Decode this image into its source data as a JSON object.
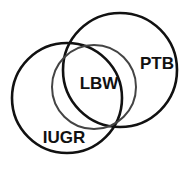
{
  "figure": {
    "type": "venn-diagram",
    "title": "",
    "background_color": "#ffffff",
    "width": 190,
    "height": 170
  },
  "sets": [
    {
      "id": "ptb",
      "label": "PTB",
      "label_x": 157,
      "label_y": 65,
      "font_size": 17,
      "circle": {
        "cx": 120,
        "cy": 70,
        "r": 57
      },
      "stroke_color": "#111111",
      "stroke_width": 2.6,
      "fill": "none"
    },
    {
      "id": "iugr",
      "label": "IUGR",
      "label_x": 64,
      "label_y": 139,
      "font_size": 17,
      "circle": {
        "cx": 67,
        "cy": 98,
        "r": 55
      },
      "stroke_color": "#111111",
      "stroke_width": 2.6,
      "fill": "none"
    },
    {
      "id": "lbw",
      "label": "LBW",
      "label_x": 99,
      "label_y": 85,
      "font_size": 17,
      "circle": {
        "cx": 94,
        "cy": 87,
        "r": 42
      },
      "stroke_color": "#444444",
      "stroke_width": 2.0,
      "fill": "none"
    }
  ],
  "chart_data": {
    "type": "venn",
    "title": "",
    "sets": [
      "PTB",
      "IUGR",
      "LBW"
    ],
    "set_labels": {
      "PTB": "PTB",
      "IUGR": "IUGR",
      "LBW": "LBW"
    },
    "geometry": {
      "PTB": {
        "cx": 120,
        "cy": 70,
        "r": 57
      },
      "IUGR": {
        "cx": 67,
        "cy": 98,
        "r": 55
      },
      "LBW": {
        "cx": 94,
        "cy": 87,
        "r": 42
      }
    },
    "overlaps": [
      [
        "PTB",
        "IUGR"
      ],
      [
        "PTB",
        "LBW"
      ],
      [
        "IUGR",
        "LBW"
      ],
      [
        "PTB",
        "IUGR",
        "LBW"
      ]
    ],
    "legend": "none",
    "grid": false
  }
}
